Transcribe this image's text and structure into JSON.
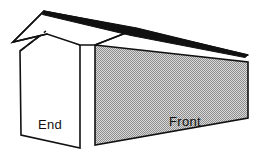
{
  "diagram": {
    "background_color": "#ffffff",
    "line_color": "#111111",
    "labels": {
      "end": "End",
      "front": "Front"
    },
    "parts": [
      {
        "name": "roof-dark-band",
        "description": "dark shaded ridge band of roof",
        "fill": "#111111",
        "points": "44,11 136,29 248,55 246,57 132,35 43,14"
      },
      {
        "name": "roof-plane-white",
        "description": "white sloping roof plane at left end",
        "fill": "#ffffff",
        "points": "44,11 13,42 47,35 78,45 95,45 136,29"
      },
      {
        "name": "end-wall",
        "description": "white gable end wall of the building",
        "fill": "#ffffff",
        "points": "20,51 46,31 80,45 80,148 21,135"
      },
      {
        "name": "front-wall",
        "description": "stippled grey front wall of the building",
        "fill": "#b8b8b8",
        "points": "95,45 248,62 248,118 95,145"
      },
      {
        "name": "hidden-ridge-dashed",
        "description": "dashed hidden ridge line from eave to gable peak",
        "from": "20,51",
        "to": "46,31"
      }
    ],
    "colors": {
      "roof_dark": "#111111",
      "wall_white": "#ffffff",
      "wall_stipple": "#b8b8b8",
      "outline": "#111111"
    },
    "label_positions": {
      "end": {
        "x": 50,
        "y": 129
      },
      "front": {
        "x": 185,
        "y": 126
      }
    }
  }
}
